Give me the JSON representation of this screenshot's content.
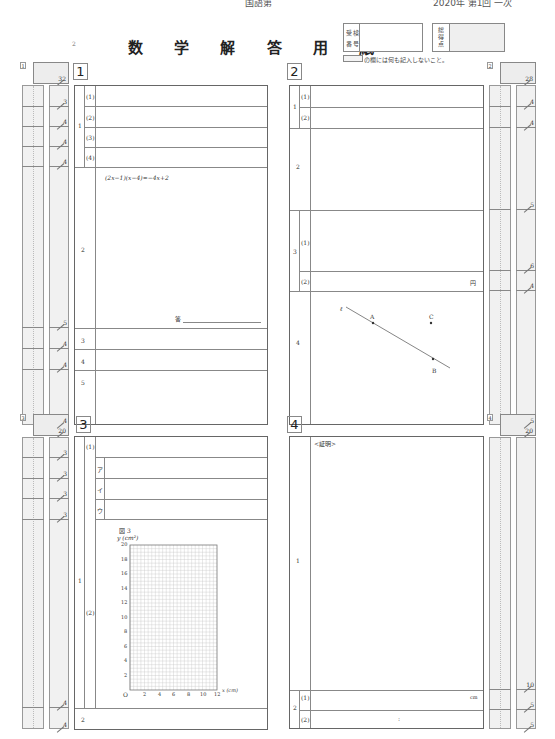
{
  "page": {
    "top_cut_text_left": "国語第",
    "top_cut_text_right": "2020年 第1回 一次",
    "page_number": "2",
    "title": "数 学 解 答 用 紙",
    "exam_number_label": [
      "受",
      "検",
      "番",
      "号"
    ],
    "total_score_label": "総得点",
    "notice": "の欄には何も記入しないこと。"
  },
  "sections": [
    {
      "number": "1",
      "total_box_tag": "1",
      "total_points": "32",
      "rows": [
        {
          "q": "1",
          "sub": "(1)",
          "points": "3"
        },
        {
          "q": "1",
          "sub": "(2)",
          "points": "4"
        },
        {
          "q": "1",
          "sub": "(3)",
          "points": "4"
        },
        {
          "q": "1",
          "sub": "(4)",
          "points": "4"
        },
        {
          "q": "2",
          "sub": "",
          "points": "5",
          "equation": "(2x−1)(x−4)=−4x+2",
          "answer_label": "答"
        },
        {
          "q": "3",
          "sub": "",
          "points": "4"
        },
        {
          "q": "4",
          "sub": "",
          "points": "4"
        },
        {
          "q": "5",
          "sub": "",
          "points": "4"
        }
      ]
    },
    {
      "number": "2",
      "total_box_tag": "2",
      "total_points": "28",
      "rows": [
        {
          "q": "1",
          "sub": "(1)",
          "points": "4"
        },
        {
          "q": "1",
          "sub": "(2)",
          "points": "4"
        },
        {
          "q": "2",
          "sub": "",
          "points": "5"
        },
        {
          "q": "3",
          "sub": "(1)",
          "points": "6"
        },
        {
          "q": "3",
          "sub": "(2)",
          "points": "4",
          "unit": "円"
        },
        {
          "q": "4",
          "sub": "",
          "points": "5",
          "figure": {
            "line_label": "ℓ",
            "points": [
              "A",
              "B",
              "C"
            ]
          }
        }
      ]
    },
    {
      "number": "3",
      "total_box_tag": "3",
      "total_points": "20",
      "rows": [
        {
          "q": "1",
          "sub": "(1)",
          "points": "3"
        },
        {
          "q": "1",
          "sub": "(2)ア",
          "points": "3",
          "kana": "ア"
        },
        {
          "q": "1",
          "sub": "(2)イ",
          "points": "3",
          "kana": "イ"
        },
        {
          "q": "1",
          "sub": "(2)ウ",
          "points": "3",
          "kana": "ウ"
        },
        {
          "q": "1",
          "sub": "(2)",
          "points": "4",
          "figure_label": "図 3"
        },
        {
          "q": "2",
          "sub": "",
          "points": "4"
        }
      ],
      "graph": {
        "title": "図 3",
        "ylabel": "y (cm²)",
        "xlabel": "x (cm)",
        "origin": "O",
        "yticks": [
          "2",
          "4",
          "6",
          "8",
          "10",
          "12",
          "14",
          "16",
          "18",
          "20"
        ],
        "xticks": [
          "2",
          "4",
          "6",
          "8",
          "10",
          "12"
        ]
      }
    },
    {
      "number": "4",
      "total_box_tag": "4",
      "total_points": "20",
      "rows": [
        {
          "q": "1",
          "sub": "",
          "points": "10",
          "proof_label": "<証明>"
        },
        {
          "q": "2",
          "sub": "(1)",
          "points": "5",
          "unit": "cm"
        },
        {
          "q": "2",
          "sub": "(2)",
          "points": "5",
          "ratio": ":"
        }
      ]
    }
  ],
  "chart_data": {
    "type": "scatter",
    "title": "図 3",
    "xlabel": "x (cm)",
    "ylabel": "y (cm²)",
    "xlim": [
      0,
      12
    ],
    "ylim": [
      0,
      20
    ],
    "x_ticks": [
      0,
      2,
      4,
      6,
      8,
      10,
      12
    ],
    "y_ticks": [
      2,
      4,
      6,
      8,
      10,
      12,
      14,
      16,
      18,
      20
    ],
    "grid": true,
    "series": []
  }
}
